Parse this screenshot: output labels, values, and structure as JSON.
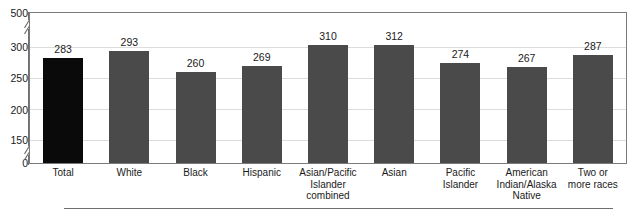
{
  "top_clip_text": "",
  "colors": {
    "bar_primary": "#4a4a4a",
    "bar_highlight": "#0a0a0a",
    "gridline": "#dcdcdc",
    "axis": "#6f6f6f",
    "text": "#1a1a1a"
  },
  "chart_data": {
    "type": "bar",
    "title": "",
    "subtitle": "",
    "xlabel": "",
    "ylabel": "",
    "categories": [
      "Total",
      "White",
      "Black",
      "Hispanic",
      "Asian/Pacific Islander combined",
      "Asian",
      "Pacific Islander",
      "American Indian/Alaska Native",
      "Two or more races"
    ],
    "category_lines": [
      [
        "Total"
      ],
      [
        "White"
      ],
      [
        "Black"
      ],
      [
        "Hispanic"
      ],
      [
        "Asian/Pacific",
        "Islander",
        "combined"
      ],
      [
        "Asian"
      ],
      [
        "Pacific",
        "Islander"
      ],
      [
        "American",
        "Indian/Alaska",
        "Native"
      ],
      [
        "Two or",
        "more races"
      ]
    ],
    "values": [
      283,
      293,
      260,
      269,
      310,
      312,
      274,
      267,
      287
    ],
    "highlight_index": 0,
    "ytick_labels": [
      "500",
      "300",
      "250",
      "200",
      "150",
      "0"
    ],
    "ytick_values": [
      500,
      300,
      250,
      200,
      150,
      0
    ],
    "ylim": [
      0,
      500
    ],
    "axis_broken": true,
    "axis_breaks": [
      "between 500 and 300",
      "between 150 and 0"
    ],
    "grid": true,
    "legend": "none",
    "data_labels": true
  }
}
